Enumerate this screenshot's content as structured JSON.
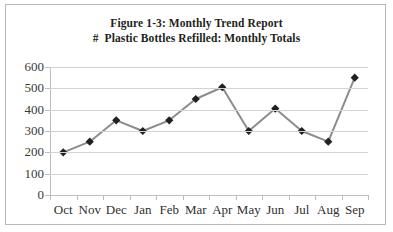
{
  "figure": {
    "border_color": "#b9b9b9",
    "background": "#ffffff"
  },
  "title": {
    "line1": "Figure 1-3: Monthly Trend Report",
    "line2": "#  Plastic Bottles Refilled: Monthly Totals"
  },
  "style": {
    "line_color": "#8c8c8c",
    "marker_color": "#231f20",
    "gridline_color": "#d3d3d3",
    "axis_color": "#bdbdbd",
    "tick_label_color": "#3a3a3a"
  },
  "chart_data": {
    "type": "line",
    "title": "Figure 1-3: Monthly Trend Report\n#  Plastic Bottles Refilled: Monthly Totals",
    "xlabel": "",
    "ylabel": "",
    "categories": [
      "Oct",
      "Nov",
      "Dec",
      "Jan",
      "Feb",
      "Mar",
      "Apr",
      "May",
      "Jun",
      "Jul",
      "Aug",
      "Sep"
    ],
    "values": [
      200,
      250,
      350,
      300,
      350,
      450,
      505,
      300,
      405,
      300,
      250,
      550
    ],
    "ylim": [
      0,
      600
    ],
    "yticks": [
      0,
      100,
      200,
      300,
      400,
      500,
      600
    ],
    "ytick_labels": [
      "0",
      "100",
      "200",
      "300",
      "400",
      "500",
      "600"
    ],
    "grid": "horizontal",
    "legend": "none",
    "marker": "diamond",
    "series": [
      {
        "name": "Plastic Bottles Refilled",
        "values": [
          200,
          250,
          350,
          300,
          350,
          450,
          505,
          300,
          405,
          300,
          250,
          550
        ]
      }
    ]
  }
}
